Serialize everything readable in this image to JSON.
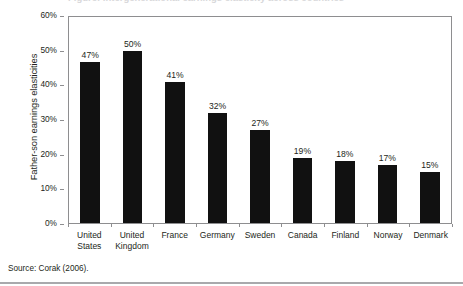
{
  "figure": {
    "title_clipped": "Figure: Intergenerational earnings elasticity across countries",
    "source_note": "Source: Corak (2006)."
  },
  "chart_data": {
    "type": "bar",
    "title": "",
    "xlabel": "",
    "ylabel": "Father-son earnings elasticities",
    "ylim": [
      0,
      60
    ],
    "ytick_labels": [
      "0%",
      "10%",
      "20%",
      "30%",
      "40%",
      "50%",
      "60%"
    ],
    "ytick_values": [
      0,
      10,
      20,
      30,
      40,
      50,
      60
    ],
    "grid": false,
    "legend": "none",
    "bar_color": "#111111",
    "categories": [
      "United States",
      "United Kingdom",
      "France",
      "Germany",
      "Sweden",
      "Canada",
      "Finland",
      "Norway",
      "Denmark"
    ],
    "values": [
      47,
      50,
      41,
      32,
      27,
      19,
      18,
      17,
      15
    ],
    "value_labels": [
      "47%",
      "50%",
      "41%",
      "32%",
      "27%",
      "19%",
      "18%",
      "17%",
      "15%"
    ]
  }
}
